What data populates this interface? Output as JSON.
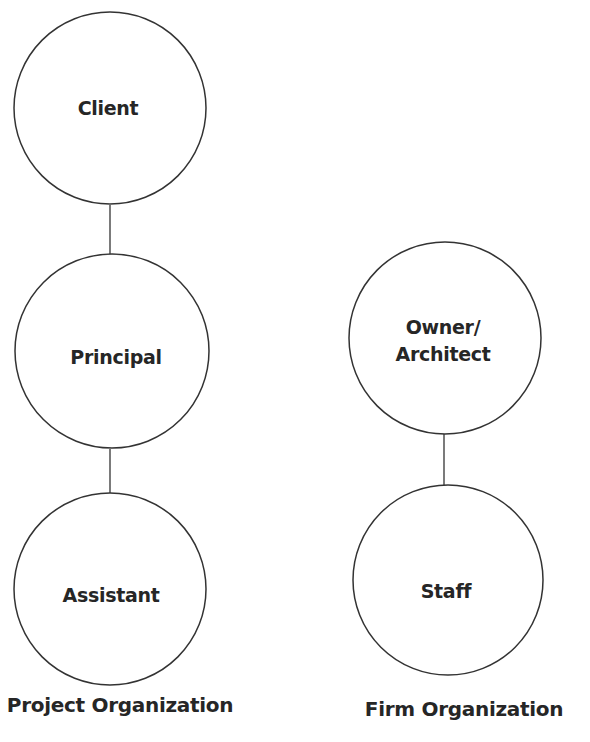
{
  "diagram": {
    "stroke_color": "#333333",
    "text_color": "#262626",
    "groups": [
      {
        "caption": "Project Organization",
        "nodes": [
          {
            "label": "Client"
          },
          {
            "label": "Principal"
          },
          {
            "label": "Assistant"
          }
        ]
      },
      {
        "caption": "Firm Organization",
        "nodes": [
          {
            "label_line1": "Owner/",
            "label_line2": "Architect"
          },
          {
            "label": "Staff"
          }
        ]
      }
    ]
  }
}
